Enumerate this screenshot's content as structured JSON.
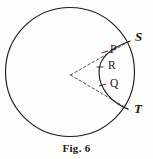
{
  "figure": {
    "caption": "Fig. 6",
    "type": "geometry-diagram",
    "colors": {
      "ink": "#1c1a18",
      "background": "#fdfdfb",
      "dashed_line": "#55504c"
    },
    "circle": {
      "center_x": 70,
      "center_y": 72,
      "radius": 65
    },
    "center_point": {
      "x": 70,
      "y": 75
    },
    "labels": {
      "S": "S",
      "T": "T",
      "P": "P",
      "R": "R",
      "Q": "Q"
    },
    "points": [
      {
        "id": "S",
        "label": "S",
        "x": 131,
        "y": 40,
        "on": "circle"
      },
      {
        "id": "T",
        "label": "T",
        "x": 129,
        "y": 110,
        "on": "circle"
      },
      {
        "id": "P",
        "label": "P",
        "x": 104,
        "y": 51,
        "on": "arc"
      },
      {
        "id": "R",
        "label": "R",
        "x": 100,
        "y": 67,
        "on": "arc"
      },
      {
        "id": "Q",
        "label": "Q",
        "x": 102,
        "y": 85,
        "on": "arc"
      }
    ],
    "dashed_segments": [
      {
        "from": "center",
        "to": "S"
      },
      {
        "from": "center",
        "to": "T"
      }
    ],
    "arc": {
      "from": "S",
      "to": "T",
      "bulge": "left"
    }
  }
}
